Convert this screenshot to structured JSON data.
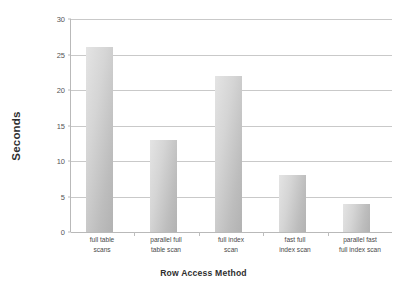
{
  "chart_data": {
    "type": "bar",
    "title": "",
    "xlabel": "Row Access Method",
    "ylabel": "Seconds",
    "categories": [
      "full table scans",
      "parallel full table scan",
      "full index scan",
      "fast full index scan",
      "parallel fast full index scan"
    ],
    "category_lines": [
      [
        "full table",
        "scans"
      ],
      [
        "parallel full",
        "table scan"
      ],
      [
        "full index",
        "scan"
      ],
      [
        "fast full",
        "index scan"
      ],
      [
        "parallel fast",
        "full index scan"
      ]
    ],
    "values": [
      26,
      13,
      22,
      8,
      4
    ],
    "ylim": [
      0,
      30
    ],
    "yticks": [
      0,
      5,
      10,
      15,
      20,
      25,
      30
    ],
    "ytick_labels": [
      "0",
      "5",
      "10",
      "15",
      "20",
      "25",
      "30"
    ],
    "grid": true,
    "legend": false,
    "legend_position": "none",
    "series": [
      {
        "name": "Seconds",
        "values": [
          26,
          13,
          22,
          8,
          4
        ]
      }
    ],
    "colors": {
      "bar_light": "#e4e4e4",
      "bar_dark": "#b2b2b2",
      "gridline": "#c9c9c9",
      "axis": "#b9b9b9",
      "text": "#3a3a3a",
      "background": "#ffffff"
    }
  }
}
